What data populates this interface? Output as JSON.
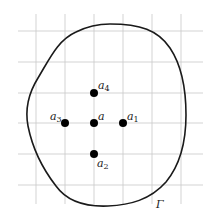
{
  "diagram": {
    "curve_label": "Γ",
    "points": [
      {
        "id": "a",
        "label": "a",
        "subscript": "",
        "grid": [
          0,
          0
        ]
      },
      {
        "id": "a1",
        "label": "a",
        "subscript": "1",
        "grid": [
          1,
          0
        ]
      },
      {
        "id": "a2",
        "label": "a",
        "subscript": "2",
        "grid": [
          0,
          -1
        ]
      },
      {
        "id": "a3",
        "label": "a",
        "subscript": "3",
        "grid": [
          -1,
          0
        ]
      },
      {
        "id": "a4",
        "label": "a",
        "subscript": "4",
        "grid": [
          0,
          1
        ]
      }
    ],
    "colors": {
      "grid": "#c8c8c8",
      "curve": "#1a1a1a",
      "points": "#000000"
    }
  }
}
